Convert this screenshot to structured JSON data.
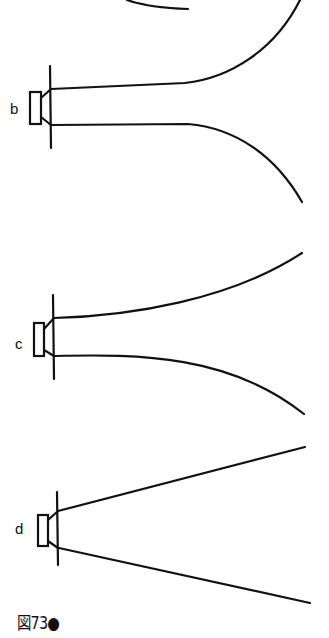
{
  "figure": {
    "caption": "図73●",
    "stroke_color": "#111111",
    "background": "#ffffff",
    "speakers": [
      {
        "id": "b",
        "label": "b",
        "horn_shape": "exponential flare (long throat, sharp flare)"
      },
      {
        "id": "c",
        "label": "c",
        "horn_shape": "gradual exponential flare"
      },
      {
        "id": "d",
        "label": "d",
        "horn_shape": "conical (straight walls)"
      }
    ],
    "partial_top": {
      "label": "",
      "note": "curve continued from previous (cut-off) horn 'a'"
    }
  }
}
